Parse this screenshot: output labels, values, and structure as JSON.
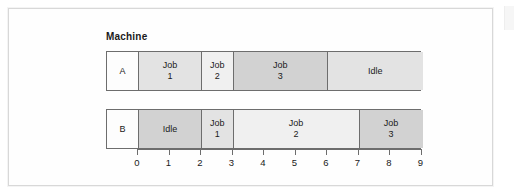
{
  "chart_title": "Machine",
  "chart_data": {
    "type": "bar",
    "subtype": "gantt",
    "title": "Machine",
    "xlabel": "",
    "ylabel": "Machine",
    "xlim": [
      0,
      9
    ],
    "grid": false,
    "legend": "none",
    "xticks": [
      "0",
      "1",
      "2",
      "3",
      "4",
      "5",
      "6",
      "7",
      "8",
      "9"
    ],
    "categories": [
      "A",
      "B"
    ],
    "time_unit_px": 31.5,
    "colors": {
      "label_cell": "#fdfdfd",
      "light": "#f0f0f0",
      "mid": "#e3e3e3",
      "dark": "#d2d2d2",
      "border": "#6d6d6d",
      "card_border": "#d8d8d8"
    },
    "rows": [
      {
        "machine": "A",
        "segments": [
          {
            "label_line1": "Job",
            "label_line2": "1",
            "start": 0,
            "end": 2,
            "shade": "mid"
          },
          {
            "label_line1": "Job",
            "label_line2": "2",
            "start": 2,
            "end": 3,
            "shade": "light"
          },
          {
            "label_line1": "Job",
            "label_line2": "3",
            "start": 3,
            "end": 6,
            "shade": "dark"
          },
          {
            "label_line1": "Idle",
            "label_line2": "",
            "start": 6,
            "end": 9,
            "shade": "mid"
          }
        ]
      },
      {
        "machine": "B",
        "segments": [
          {
            "label_line1": "Idle",
            "label_line2": "",
            "start": 0,
            "end": 2,
            "shade": "dark"
          },
          {
            "label_line1": "Job",
            "label_line2": "1",
            "start": 2,
            "end": 3,
            "shade": "mid"
          },
          {
            "label_line1": "Job",
            "label_line2": "2",
            "start": 3,
            "end": 7,
            "shade": "light"
          },
          {
            "label_line1": "Job",
            "label_line2": "3",
            "start": 7,
            "end": 9,
            "shade": "dark"
          }
        ]
      }
    ]
  }
}
